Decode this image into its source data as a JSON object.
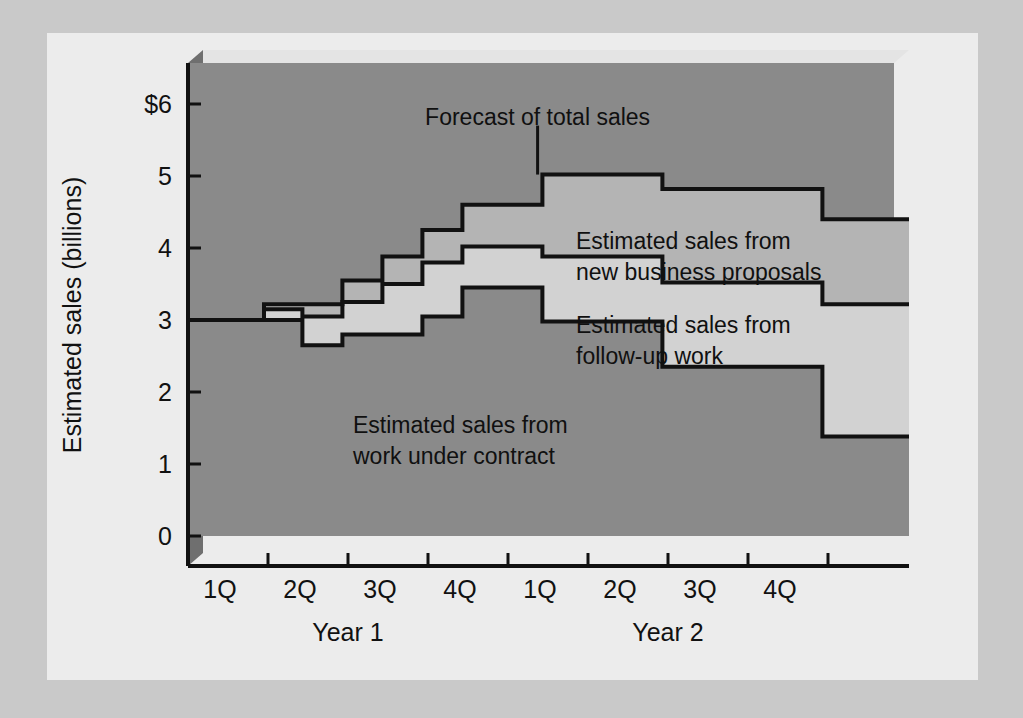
{
  "figure": {
    "background": "#ececec",
    "page_background": "#c9c9c9"
  },
  "chart_data": {
    "type": "area",
    "subtype": "stacked-step-area",
    "title": "",
    "xlabel": "",
    "ylabel": "Estimated sales (billions)",
    "ylim": [
      0,
      6.4
    ],
    "yticks": [
      0,
      1,
      2,
      3,
      4,
      5,
      6
    ],
    "ytick_labels": [
      "0",
      "1",
      "2",
      "3",
      "4",
      "5",
      "$6"
    ],
    "grid": false,
    "legend_position": "inline-annotations",
    "xtick_labels": [
      "1Q",
      "2Q",
      "3Q",
      "4Q",
      "1Q",
      "2Q",
      "3Q",
      "4Q"
    ],
    "x_group_labels": [
      "Year 1",
      "Year 2"
    ],
    "x_range_quarters": [
      0,
      8.6
    ],
    "colors": {
      "plot_background": "#8a8a8a",
      "band_work_under_contract": "#8a8a8a",
      "band_follow_up_work": "#d2d2d2",
      "band_new_business_proposals": "#b4b4b4",
      "line": "#111111",
      "bevel_light": "#e8e8e8",
      "bevel_dark": "#6f6f6f"
    },
    "series": [
      {
        "name": "Estimated sales from work under contract",
        "label_lines": [
          "Estimated sales from",
          "work under contract"
        ],
        "step_x": [
          -0.45,
          0.5,
          0.98,
          1.48,
          1.98,
          2.48,
          2.98,
          3.48,
          3.98,
          5.48,
          7.48,
          8.6
        ],
        "values": [
          3.0,
          3.0,
          2.65,
          2.8,
          2.8,
          3.05,
          3.45,
          3.45,
          2.98,
          2.35,
          1.38,
          1.38
        ]
      },
      {
        "name": "Estimated sales from follow-up work",
        "label_lines": [
          "Estimated sales from",
          "follow-up work"
        ],
        "step_x": [
          -0.45,
          0.5,
          0.98,
          1.48,
          1.98,
          2.48,
          2.98,
          3.48,
          3.98,
          5.48,
          7.48,
          8.6
        ],
        "cumulative": [
          3.0,
          3.15,
          3.05,
          3.25,
          3.5,
          3.8,
          4.02,
          4.02,
          3.88,
          3.52,
          3.22,
          3.22
        ]
      },
      {
        "name": "Estimated sales from new business proposals",
        "label_lines": [
          "Estimated sales from",
          "new business proposals"
        ],
        "step_x": [
          -0.45,
          0.5,
          0.98,
          1.48,
          1.98,
          2.48,
          2.98,
          3.48,
          3.98,
          5.48,
          7.48,
          8.6
        ],
        "cumulative": [
          3.0,
          3.22,
          3.22,
          3.55,
          3.88,
          4.25,
          4.6,
          4.6,
          5.02,
          4.82,
          4.4,
          4.4
        ]
      }
    ],
    "annotations": [
      {
        "name": "forecast-callout",
        "text": "Forecast of total sales",
        "x_quarter": 3.92,
        "y_text": 5.82,
        "leader_from_y": 5.7,
        "leader_to_y": 5.02
      }
    ]
  },
  "axis": {
    "y_title": "Estimated sales (billions)",
    "y_tick_labels": [
      "$6",
      "5",
      "4",
      "3",
      "2",
      "1",
      "0"
    ],
    "x_tick_labels": [
      "1Q",
      "2Q",
      "3Q",
      "4Q",
      "1Q",
      "2Q",
      "3Q",
      "4Q"
    ],
    "year_labels": [
      "Year 1",
      "Year 2"
    ]
  },
  "labels": {
    "forecast": "Forecast of total sales",
    "new_business_line1": "Estimated sales from",
    "new_business_line2": "new business proposals",
    "follow_up_line1": "Estimated sales from",
    "follow_up_line2": "follow-up work",
    "contract_line1": "Estimated sales from",
    "contract_line2": "work under contract"
  }
}
